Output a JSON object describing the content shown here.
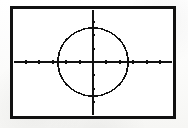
{
  "page": {
    "kind": "graphing-calculator-screen",
    "background_color": "#fdfdfc",
    "ink_color": "#111111"
  },
  "frame": {
    "x": 10,
    "y": 6,
    "width": 166,
    "height": 113,
    "border_color": "#111111",
    "border_width": 3,
    "fill_color": "#ffffff"
  },
  "chart_data": {
    "type": "scatter",
    "title": "",
    "subtitle": "",
    "xlabel": "",
    "ylabel": "",
    "legend": [],
    "annotations": [],
    "grid": false,
    "axis_color": "#111111",
    "curve_color": "#111111",
    "xlim": [
      -6.2,
      6.2
    ],
    "ylim": [
      -4.2,
      4.2
    ],
    "x_tick_step": 1,
    "y_tick_step": 1,
    "x_tick_values": [
      -6,
      -5,
      -4,
      -3,
      -2,
      -1,
      1,
      2,
      3,
      4,
      5,
      6
    ],
    "y_tick_values": [
      -4,
      -3,
      -2,
      -1,
      1,
      2,
      3,
      4
    ],
    "x_tick_labels": [],
    "y_tick_labels": [],
    "tick_length_px": 3,
    "series": [
      {
        "name": "circle",
        "type": "implicit-circle",
        "equation": "x^2 + y^2 = r^2",
        "center_x": 0,
        "center_y": 0,
        "radius": 2.6,
        "pixel_center_x": 93,
        "pixel_center_y": 62,
        "pixel_radius_x": 35,
        "pixel_radius_y": 34,
        "render_style": "pixelated-stepped",
        "stroke_color": "#111111",
        "stroke_width": 1.6
      }
    ],
    "axes": [
      {
        "name": "x-axis",
        "orientation": "horizontal",
        "pixel_position": 62,
        "spans_full_width": true
      },
      {
        "name": "y-axis",
        "orientation": "vertical",
        "pixel_position": 93,
        "spans_full_height": true
      }
    ]
  }
}
